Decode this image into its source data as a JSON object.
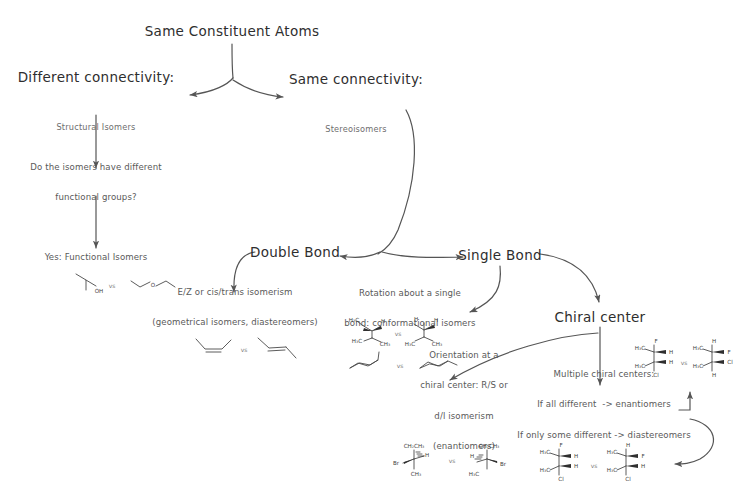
{
  "diagram": {
    "background_color": "#ffffff",
    "line_color": "#555555",
    "text_color": "#3a3a3a"
  },
  "nodes": {
    "root": {
      "label": "Same Constituent Atoms"
    },
    "different_connectivity": {
      "label": "Different connectivity:",
      "sublabel": "Structural Isomers"
    },
    "same_connectivity": {
      "label": "Same connectivity:",
      "sublabel": "Stereoisomers"
    },
    "question_functional": {
      "line1": "Do the isomers have different",
      "line2": "functional groups?"
    },
    "functional_isomers": {
      "label": "Yes: Functional Isomers"
    },
    "double_bond": {
      "label": "Double Bond"
    },
    "single_bond": {
      "label": "Single Bond"
    },
    "geometric": {
      "line1": "E/Z or cis/trans isomerism",
      "line2": "(geometrical isomers, diastereomers)"
    },
    "conformational": {
      "line1": "Rotation about a single",
      "line2": "bond: conformational isomers"
    },
    "chiral_center": {
      "label": "Chiral center"
    },
    "orientation": {
      "line1": "Orientation at a",
      "line2": "chiral center: R/S or",
      "line3": "d/l isomerism",
      "line4": "(enantiomers)"
    },
    "multiple_chiral": {
      "line1": "Multiple chiral centers:",
      "line2": "If all different  -> enantiomers",
      "line3": "If only some different -> diastereomers"
    }
  },
  "vs_labels": {
    "functional": "vs",
    "geometric": "vs",
    "newman": "vs",
    "chair": "vs",
    "enantiomer": "vs",
    "chiral_top": "vs",
    "chiral_bottom": "vs"
  },
  "molecule_labels": {
    "isopropanol_oh": "OH",
    "ether_o": "O",
    "newman_left": [
      "H₃C",
      "H₃C",
      "H",
      "H",
      "CH₃"
    ],
    "newman_right": [
      "H",
      "H",
      "H",
      "H₃C",
      "CH₃"
    ],
    "enantiomer_left": [
      "CH₂CH₃",
      "Br",
      "H",
      "CH₃"
    ],
    "enantiomer_right": [
      "CH₂CH₃",
      "H",
      "H₃C",
      "Br"
    ],
    "chiral_top_left": [
      "H₃C",
      "F",
      "H",
      "H",
      "H₃C",
      "Cl"
    ],
    "chiral_top_right": [
      "H₃C",
      "H",
      "F",
      "Cl",
      "H₃C",
      "H"
    ],
    "chiral_bottom_left": [
      "H₃C",
      "F",
      "H",
      "H",
      "H₃C",
      "Cl"
    ],
    "chiral_bottom_right": [
      "H₃C",
      "H",
      "F",
      "H",
      "H₃C",
      "Cl"
    ]
  }
}
